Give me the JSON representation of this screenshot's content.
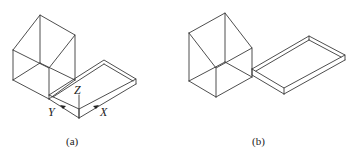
{
  "figure": {
    "panels": [
      {
        "id": "a",
        "caption": "(a)",
        "axes": {
          "x_label": "X",
          "y_label": "Y",
          "z_label": "Z"
        },
        "description": "Isometric wireframe of a pentagonal-prism house shape with a flat rectangular slab attached, shown with coordinate axes at slab corner"
      },
      {
        "id": "b",
        "caption": "(b)",
        "description": "Isometric wireframe of the house shape and slab separated along a shared edge"
      }
    ],
    "colors": {
      "line": "#3a3a3a",
      "background": "#ffffff"
    }
  }
}
